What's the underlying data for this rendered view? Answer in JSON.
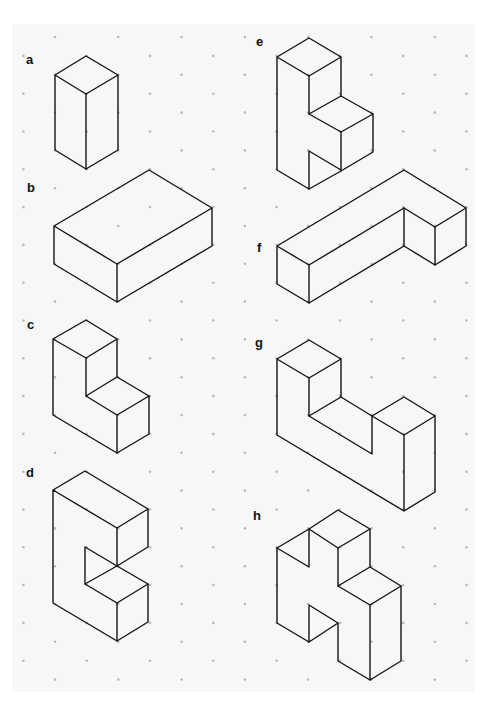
{
  "page": {
    "background": "#ffffff",
    "sheet_color": "#f7f7f7",
    "dot_color": "#b9b9b9",
    "line_color": "#141414",
    "grid": {
      "type": "isometric-dot",
      "row_start_y": 37,
      "row_step_y": 18.9,
      "col_step_x": 63.3,
      "even_row_x0": 55,
      "odd_row_x0": 23.4,
      "rows": 35
    }
  },
  "figures": [
    {
      "label": "a",
      "label_pos": [
        29,
        53
      ],
      "description": "rectangular prism 1x1x2 (tall)"
    },
    {
      "label": "b",
      "label_pos": [
        29,
        187
      ],
      "description": "rectangular prism 3x2x1 (flat)"
    },
    {
      "label": "c",
      "label_pos": [
        29,
        327
      ],
      "description": "L-shaped step block"
    },
    {
      "label": "d",
      "label_pos": [
        29,
        475
      ],
      "description": "C-shaped block with notch"
    },
    {
      "label": "e",
      "label_pos": [
        256,
        41
      ],
      "description": "stepped tower with notch"
    },
    {
      "label": "f",
      "label_pos": [
        256,
        250
      ],
      "description": "long L-shaped bar"
    },
    {
      "label": "g",
      "label_pos": [
        256,
        345
      ],
      "description": "U-shaped block"
    },
    {
      "label": "h",
      "label_pos": [
        256,
        528
      ],
      "description": "H-like block with two notches"
    }
  ]
}
